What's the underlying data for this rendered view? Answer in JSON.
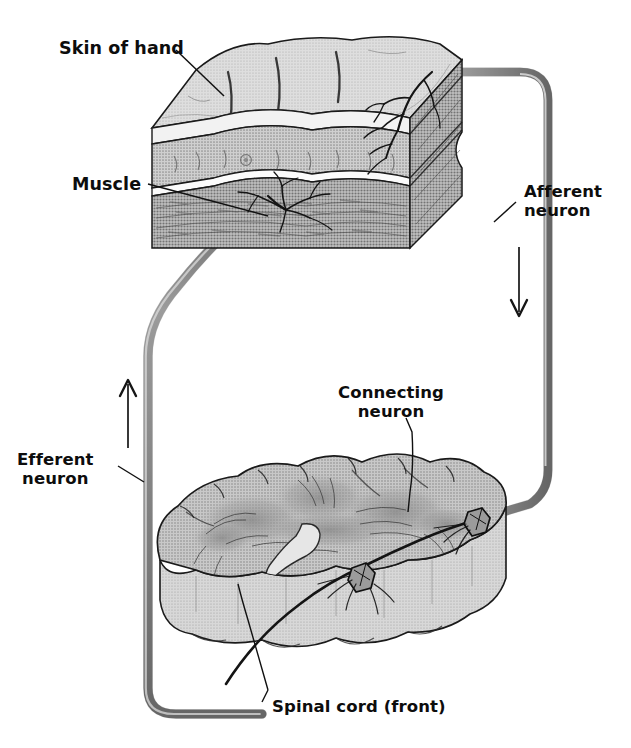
{
  "figure": {
    "background_color": "#ffffff",
    "ink_color": "#0d0d0d",
    "tissue_fill_light": "#d2d2d2",
    "tissue_fill_mid": "#bcbcbc",
    "tissue_fill_dark": "#a6a6a6",
    "nerve_color": "#9a9a9a",
    "nerve_edge_color": "#5f5f5f"
  },
  "labels": {
    "skin_of_hand": "Skin of hand",
    "muscle": "Muscle",
    "afferent_neuron": "Afferent\nneuron",
    "afferent_neuron_line1": "Afferent",
    "afferent_neuron_line2": "neuron",
    "efferent_neuron_line1": "Efferent",
    "efferent_neuron_line2": "neuron",
    "connecting_neuron_line1": "Connecting",
    "connecting_neuron_line2": "neuron",
    "spinal_cord": "Spinal cord (front)"
  },
  "structures": {
    "skin_block": {
      "name": "Block of skin from the hand",
      "layers": [
        "epidermis",
        "dermis",
        "muscle"
      ]
    },
    "spinal_cord_block": {
      "name": "Transverse slab of spinal cord, front view",
      "features": [
        "gray matter butterfly",
        "central canal",
        "anterior median fissure"
      ]
    },
    "afferent_pathway": {
      "name": "Afferent (sensory) neuron",
      "direction": "toward spinal cord",
      "arrow": "down"
    },
    "efferent_pathway": {
      "name": "Efferent (motor) neuron",
      "direction": "toward muscle",
      "arrow": "up"
    },
    "connecting_pathway": {
      "name": "Connecting (relay) neuron inside spinal cord"
    }
  }
}
